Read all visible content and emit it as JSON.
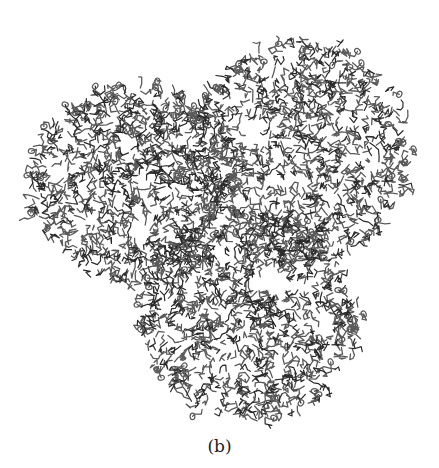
{
  "figure": {
    "caption": "(b)",
    "stroke_color": "#5a5a5a",
    "dark_stroke_color": "#2a2a2a",
    "lobes": [
      {
        "name": "upper-left",
        "cx": 135,
        "cy": 185,
        "rx": 105,
        "ry": 100
      },
      {
        "name": "upper-right",
        "cx": 300,
        "cy": 150,
        "rx": 110,
        "ry": 110
      },
      {
        "name": "bottom",
        "cx": 250,
        "cy": 315,
        "rx": 110,
        "ry": 105
      }
    ],
    "holes": [
      {
        "cx": 253,
        "cy": 135,
        "r": 14
      },
      {
        "cx": 225,
        "cy": 218,
        "r": 9
      },
      {
        "cx": 140,
        "cy": 228,
        "r": 14
      },
      {
        "cx": 275,
        "cy": 278,
        "r": 14
      }
    ]
  }
}
